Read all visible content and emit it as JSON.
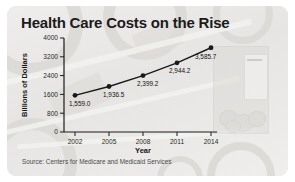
{
  "chart_data": {
    "type": "line",
    "title": "Health Care Costs on the Rise",
    "xlabel": "Year",
    "ylabel": "Billions of Dollars",
    "categories": [
      "2002",
      "2005",
      "2008",
      "2011",
      "2014"
    ],
    "x": [
      2002,
      2005,
      2008,
      2011,
      2014
    ],
    "values": [
      1559.0,
      1936.5,
      2399.2,
      2944.2,
      3585.7
    ],
    "point_labels": [
      "1,559.0",
      "1,936.5",
      "2,399.2",
      "2,944.2",
      "3,585.7"
    ],
    "ylim": [
      0,
      4000
    ],
    "y_ticks": [
      "0",
      "800",
      "1600",
      "2400",
      "3200",
      "4000"
    ],
    "y_tick_values": [
      0,
      800,
      1600,
      2400,
      3200,
      4000
    ],
    "x_ticks": [
      "2002",
      "2005",
      "2008",
      "2011",
      "2014"
    ],
    "grid": false,
    "legend": "none",
    "series": [
      {
        "name": "National health expenditures",
        "values": [
          1559.0,
          1936.5,
          2399.2,
          2944.2,
          3585.7
        ]
      }
    ],
    "marker": "filled-circle",
    "line_color": "#1a1a1a",
    "marker_color": "#1a1a1a",
    "source": "Source: Centers for Medicare and Medicaid Services"
  },
  "card": {
    "title": "Health Care Costs on the Rise",
    "source": "Source: Centers for Medicare and Medicaid Services",
    "background_color": "#e9e8e6",
    "accent_color": "#1a1a1a"
  },
  "background_photo": {
    "description": "faded photo of a jar of coins"
  }
}
